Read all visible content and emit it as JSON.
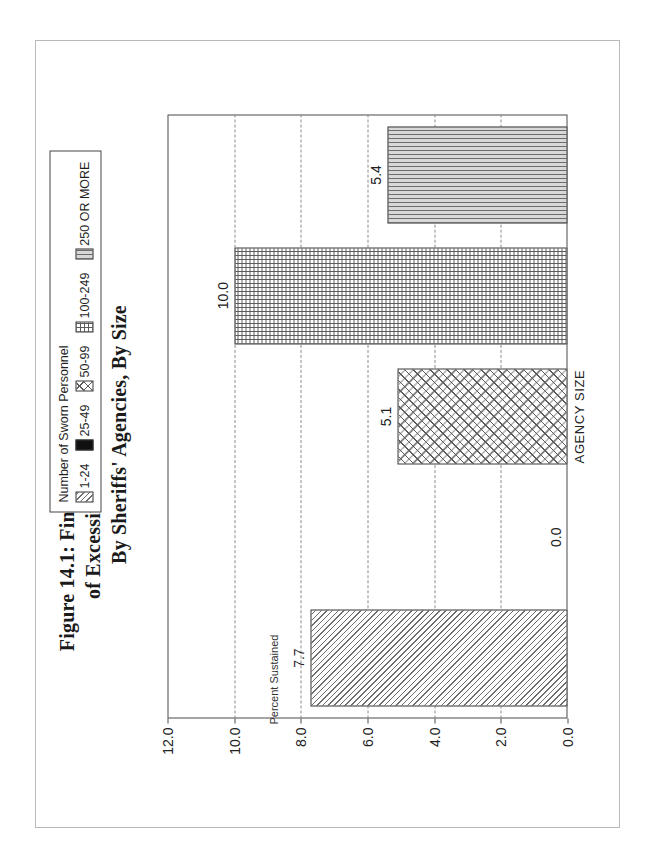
{
  "figure": {
    "title_lines": [
      "Figure 14.1: Final Disposition of 1991 Complaints",
      "of Excessive Force: Percent Sustained",
      "By Sheriffs' Agencies, By Size"
    ],
    "orientation": "rotated-90-landscape"
  },
  "legend": {
    "title": "Number of Sworn Personnel",
    "items": [
      {
        "label": "1-24",
        "pattern": "diagonal-hatch"
      },
      {
        "label": "25-49",
        "pattern": "solid-black"
      },
      {
        "label": "50-99",
        "pattern": "crosshatch"
      },
      {
        "label": "100-249",
        "pattern": "fine-grid"
      },
      {
        "label": "250 OR MORE",
        "pattern": "vertical-lines"
      }
    ]
  },
  "chart_data": {
    "type": "bar",
    "title": "Figure 14.1: Final Disposition of 1991 Complaints of Excessive Force: Percent Sustained By Sheriffs' Agencies, By Size",
    "xlabel": "AGENCY SIZE",
    "ylabel": "Percent Sustained",
    "categories": [
      "1-24",
      "25-49",
      "50-99",
      "100-249",
      "250 OR MORE"
    ],
    "values": [
      7.7,
      0.0,
      5.1,
      10.0,
      5.4
    ],
    "data_labels": [
      "7.7",
      "0.0",
      "5.1",
      "10.0",
      "5.4"
    ],
    "ylim": [
      0,
      12
    ],
    "yticks": [
      0.0,
      2.0,
      4.0,
      6.0,
      8.0,
      10.0,
      12.0
    ],
    "ytick_labels": [
      "0.0",
      "2.0",
      "4.0",
      "6.0",
      "8.0",
      "10.0",
      "12.0"
    ],
    "grid": "horizontal-dashed",
    "legend_position": "top-right-outside",
    "legend_title": "Number of Sworn Personnel",
    "series_patterns": [
      "diagonal-hatch",
      "solid-black",
      "crosshatch",
      "fine-grid",
      "vertical-lines"
    ]
  },
  "colors": {
    "frame": "#4a4a4a",
    "gridline": "#8a8a8a",
    "text": "#1a1a1a",
    "page_border": "#b9b9b9"
  }
}
